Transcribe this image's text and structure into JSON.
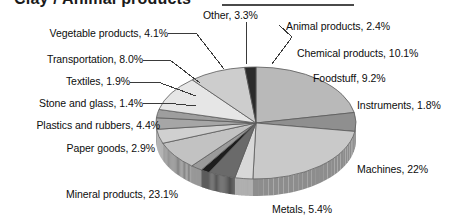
{
  "title": {
    "text": "Clay / Animal products",
    "rule_color": "#4a4a4a"
  },
  "labels": {
    "vegetable": "Vegetable products, 4.1%",
    "transportation": "Transportation, 8.0%",
    "textiles": "Textiles, 1.9%",
    "stone_glass": "Stone and glass, 1.4%",
    "plastics": "Plastics and rubbers, 4.4%",
    "paper": "Paper goods, 2.9%",
    "mineral": "Mineral products, 23.1%",
    "metals": "Metals, 5.4%",
    "machines": "Machines, 22%",
    "instruments": "Instruments, 1.8%",
    "foodstuff": "Foodstuff, 9.2%",
    "chemical": "Chemical products, 10.1%",
    "animal": "Animal products, 2.4%",
    "other": "Other, 3.3%"
  },
  "chart_data": {
    "type": "pie",
    "title": "Clay / Animal products",
    "xlabel": "",
    "ylabel": "",
    "legend_position": "callout-labels",
    "grid": false,
    "three_d": true,
    "start_angle_deg": -90,
    "direction": "clockwise",
    "categories": [
      "Machines",
      "Metals",
      "Mineral products",
      "Paper goods",
      "Plastics and rubbers",
      "Stone and glass",
      "Textiles",
      "Transportation",
      "Vegetable products",
      "Other",
      "Animal products",
      "Chemical products",
      "Foodstuff",
      "Instruments"
    ],
    "values": [
      22,
      5.4,
      23.1,
      2.9,
      4.4,
      1.4,
      1.9,
      8.0,
      4.1,
      3.3,
      2.4,
      10.1,
      9.2,
      1.8
    ],
    "value_labels": [
      "22%",
      "5.4%",
      "23.1%",
      "2.9%",
      "4.4%",
      "1.4%",
      "1.9%",
      "8.0%",
      "4.1%",
      "3.3%",
      "2.4%",
      "10.1%",
      "9.2%",
      "1.8%"
    ],
    "unit": "percent",
    "total": 100.0,
    "colors": [
      "#b9b9b9",
      "#8f8f8f",
      "#c9c9c9",
      "#d8d8d8",
      "#6a6a6a",
      "#1d1d1d",
      "#9a9a9a",
      "#c2c2c2",
      "#d0d0d0",
      "#a6a6a6",
      "#9e9e9e",
      "#e6e6e6",
      "#cdcdcd",
      "#2b2b2b"
    ]
  }
}
